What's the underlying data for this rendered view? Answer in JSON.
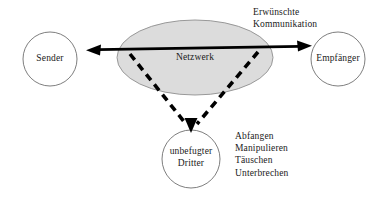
{
  "diagram": {
    "type": "network-security-communication",
    "nodes": [
      {
        "id": "sender",
        "label": "Sender",
        "shape": "circle",
        "fill": "#ffffff",
        "cx": 50,
        "cy": 59,
        "r": 27
      },
      {
        "id": "netzwerk",
        "label": "Netzwerk",
        "shape": "ellipse",
        "fill": "#dcdcdc",
        "cx": 195,
        "cy": 57.5,
        "rx": 78,
        "ry": 37.5
      },
      {
        "id": "empfaenger",
        "label": "Empfänger",
        "shape": "circle",
        "fill": "#ffffff",
        "cx": 338,
        "cy": 59,
        "r": 27
      },
      {
        "id": "dritter",
        "label_line1": "unbefugter",
        "label_line2": "Dritter",
        "shape": "circle",
        "fill": "#ffffff",
        "cx": 191,
        "cy": 159,
        "r": 29
      }
    ],
    "edges": [
      {
        "id": "desired-communication",
        "style": "solid",
        "color": "#000000",
        "arrowheads": "both",
        "label_line1": "Erwünschte",
        "label_line2": "Kommunikation",
        "from": "sender",
        "to": "empfaenger"
      },
      {
        "id": "attack-path-left",
        "style": "dashed",
        "color": "#000000",
        "arrowheads": "end",
        "from": "netzwerk-left",
        "to": "dritter"
      },
      {
        "id": "attack-path-right",
        "style": "dashed",
        "color": "#000000",
        "arrowheads": "end",
        "from": "netzwerk-right",
        "to": "dritter"
      }
    ],
    "annotations": {
      "desired_communication": {
        "line1": "Erwünschte",
        "line2": "Kommunikation"
      },
      "attack_list": [
        "Abfangen",
        "Manipulieren",
        "Täuschen",
        "Unterbrechen"
      ]
    },
    "colors": {
      "stroke": "#4a4a4a",
      "arrow": "#000000",
      "network_fill": "#dcdcdc",
      "node_fill": "#ffffff",
      "text": "#1a1a1a",
      "background": "#ffffff"
    }
  }
}
